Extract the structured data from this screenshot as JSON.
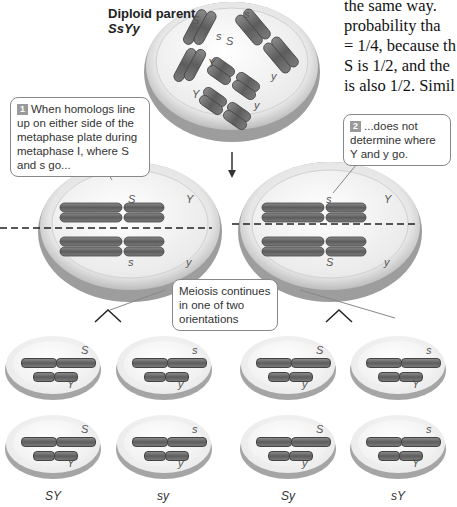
{
  "header": {
    "title": "Diploid parent",
    "genotype": "SsYy"
  },
  "book_text": {
    "lines": [
      "the same way.",
      "probability tha",
      "= 1/4, because th",
      "S is 1/2, and the",
      "is also 1/2. Simil"
    ]
  },
  "parent_cell": {
    "alleles": [
      "S",
      "s",
      "S",
      "s",
      "Y",
      "Y",
      "y",
      "y"
    ]
  },
  "callouts": [
    {
      "number": "1",
      "text": "When homologs line up on either side of the metaphase plate during metaphase I, where S and s go..."
    },
    {
      "number": "2",
      "text": "...does not determine where Y and y go."
    },
    {
      "number": "",
      "text": "Meiosis continues in one of two orientations"
    }
  ],
  "metaphase_cells": [
    {
      "top_S": "S",
      "top_Y": "Y",
      "bottom_S": "s",
      "bottom_Y": "y"
    },
    {
      "top_S": "s",
      "top_Y": "Y",
      "bottom_S": "S",
      "bottom_Y": "y"
    }
  ],
  "gametes": {
    "top_row": [
      {
        "s_allele": "S",
        "y_allele": "Y"
      },
      {
        "s_allele": "s",
        "y_allele": "y"
      },
      {
        "s_allele": "S",
        "y_allele": "y"
      },
      {
        "s_allele": "s",
        "y_allele": "Y"
      }
    ],
    "bottom_row": [
      {
        "s_allele": "S",
        "y_allele": "Y"
      },
      {
        "s_allele": "s",
        "y_allele": "y"
      },
      {
        "s_allele": "S",
        "y_allele": "y"
      },
      {
        "s_allele": "s",
        "y_allele": "Y"
      }
    ],
    "labels": [
      "SY",
      "sy",
      "Sy",
      "sY"
    ]
  },
  "colors": {
    "chromosome": "#6b6b6b",
    "cell_fill": "#f1f1f1",
    "cell_rim": "#bdbdbd",
    "badge": "#9a9a9a"
  }
}
